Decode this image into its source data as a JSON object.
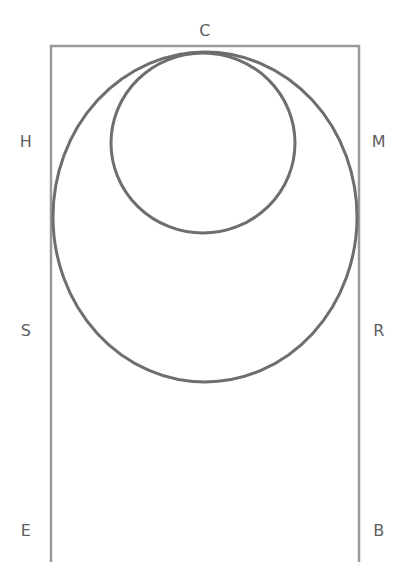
{
  "figure": {
    "background_color": "#ffffff",
    "width": 411,
    "height": 588
  },
  "style": {
    "circle_stroke_color": "#6e6e6e",
    "circle_stroke_width": 3,
    "line_stroke_color": "#9a9a9a",
    "line_stroke_width": 2.5,
    "label_color": "#5e5e5e",
    "label_font_size_px": 16
  },
  "labels": [
    {
      "id": "label-C",
      "text": "C",
      "x": 205,
      "y": 31,
      "position": "top-center"
    },
    {
      "id": "label-H",
      "text": "H",
      "x": 26,
      "y": 142,
      "position": "left-upper"
    },
    {
      "id": "label-M",
      "text": "M",
      "x": 379,
      "y": 142,
      "position": "right-upper"
    },
    {
      "id": "label-S",
      "text": "S",
      "x": 26,
      "y": 331,
      "position": "left-lower"
    },
    {
      "id": "label-R",
      "text": "R",
      "x": 379,
      "y": 331,
      "position": "right-lower"
    },
    {
      "id": "label-E",
      "text": "E",
      "x": 26,
      "y": 531,
      "position": "bottom-left"
    },
    {
      "id": "label-B",
      "text": "B",
      "x": 379,
      "y": 531,
      "position": "bottom-right"
    }
  ],
  "shapes": {
    "top_line": {
      "name": "top-horizontal-line",
      "x1": 50,
      "y1": 46,
      "x2": 360,
      "y2": 46
    },
    "left_line": {
      "name": "left-vertical-line",
      "x1": 51,
      "y1": 45,
      "x2": 51,
      "y2": 562
    },
    "right_line": {
      "name": "right-vertical-line",
      "x1": 359,
      "y1": 45,
      "x2": 359,
      "y2": 562
    },
    "large_circle": {
      "name": "large-circle",
      "cx": 205,
      "cy": 217,
      "rx": 152,
      "ry": 165
    },
    "small_circle": {
      "name": "small-circle",
      "cx": 203,
      "cy": 143,
      "rx": 92,
      "ry": 90
    }
  },
  "chart_data": {
    "type": "diagram",
    "elements": [
      {
        "kind": "line",
        "name": "top-horizontal-line",
        "from": [
          50,
          46
        ],
        "to": [
          360,
          46
        ],
        "endpoints_labeled": [
          "H-side-top",
          "M-side-top"
        ]
      },
      {
        "kind": "line",
        "name": "left-vertical-line",
        "from": [
          51,
          45
        ],
        "to": [
          51,
          562
        ],
        "labels_along": [
          "H",
          "S",
          "E"
        ]
      },
      {
        "kind": "line",
        "name": "right-vertical-line",
        "from": [
          359,
          45
        ],
        "to": [
          359,
          562
        ],
        "labels_along": [
          "M",
          "R",
          "B"
        ]
      },
      {
        "kind": "ellipse",
        "name": "large-circle",
        "center": [
          205,
          217
        ],
        "radius_x": 152,
        "radius_y": 165,
        "tangent_points": [
          "C (top)",
          "left-vertical-line",
          "right-vertical-line"
        ]
      },
      {
        "kind": "ellipse",
        "name": "small-circle",
        "center": [
          203,
          143
        ],
        "radius_x": 92,
        "radius_y": 90,
        "tangent_points": [
          "C (top)"
        ]
      }
    ],
    "point_labels": [
      "C",
      "H",
      "M",
      "S",
      "R",
      "E",
      "B"
    ]
  }
}
